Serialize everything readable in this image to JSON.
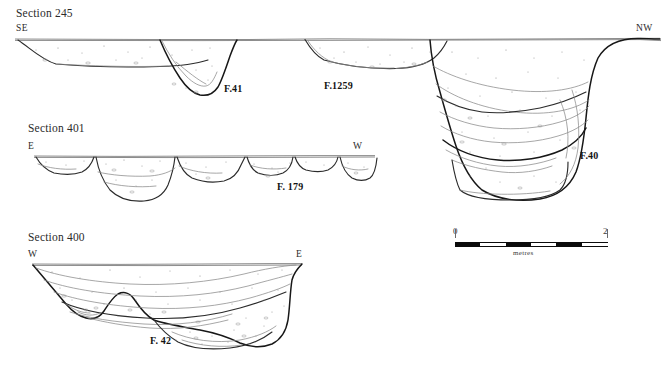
{
  "page": {
    "kind": "archaeological-section-drawing",
    "background_color": "#ffffff",
    "ink_color": "#2b2b2b"
  },
  "sections": [
    {
      "id": "section-245",
      "title": "Section 245",
      "left_orientation": "SE",
      "right_orientation": "NW",
      "features": [
        "F.41",
        "F.1259",
        "F.40"
      ]
    },
    {
      "id": "section-401",
      "title": "Section 401",
      "left_orientation": "E",
      "right_orientation": "W",
      "features": [
        "F. 179"
      ]
    },
    {
      "id": "section-400",
      "title": "Section 400",
      "left_orientation": "W",
      "right_orientation": "E",
      "features": [
        "F. 42"
      ]
    }
  ],
  "labels": {
    "section_245_title": "Section 245",
    "section_245_left": "SE",
    "section_245_right": "NW",
    "feature_41": "F.41",
    "feature_1259": "F.1259",
    "feature_40": "F.40",
    "section_401_title": "Section 401",
    "section_401_left": "E",
    "section_401_right": "W",
    "feature_179": "F. 179",
    "section_400_title": "Section 400",
    "section_400_left": "W",
    "section_400_right": "E",
    "feature_42": "F. 42"
  },
  "scale_bar": {
    "min_label": "0",
    "max_label": "2",
    "unit_label": "metres",
    "segments": 4,
    "segment_colors": [
      "#0b0b0b",
      "#ffffff",
      "#0b0b0b",
      "#ffffff",
      "#0b0b0b"
    ],
    "bar_color": "#0b0b0b"
  }
}
